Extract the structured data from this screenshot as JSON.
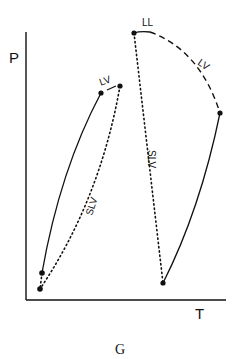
{
  "diagram": {
    "caption": "G",
    "axes": {
      "y_label": "P",
      "x_label": "T"
    },
    "curve_labels": {
      "left_top": "LV",
      "left_slv": "SLV",
      "right_top_ll": "LL",
      "right_top_lv": "LV",
      "right_slv": "SLV"
    },
    "colors": {
      "ink": "#111111",
      "background": "#ffffff"
    }
  }
}
